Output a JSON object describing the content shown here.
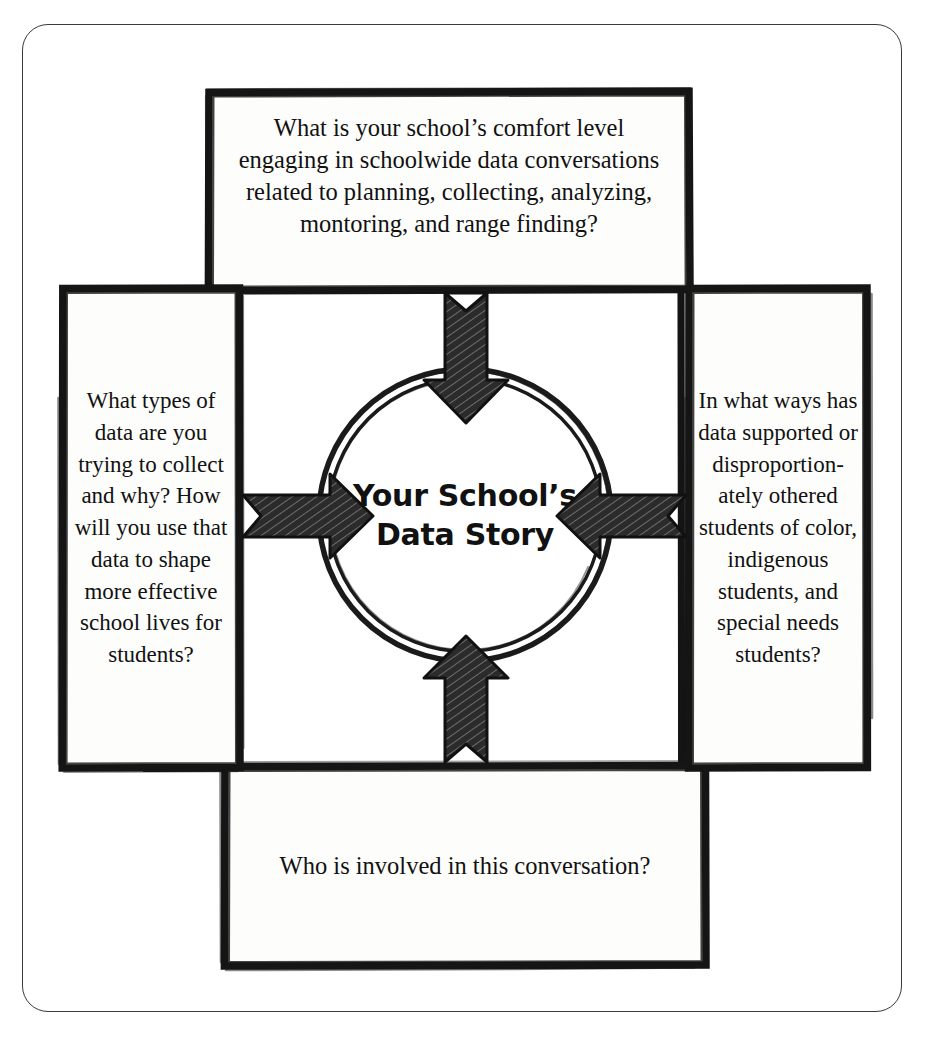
{
  "diagram": {
    "center": {
      "line1": "Your School’s",
      "line2": "Data Story"
    },
    "boxes": {
      "top": {
        "id": "top-question-box",
        "text": "What is your school’s comfort level engaging in schoolwide data conversations related to planning, collecting, analyzing, montoring, and range finding?"
      },
      "left": {
        "id": "left-question-box",
        "text": "What types of data are you trying to collect and why?  How will you use that data to shape more effective school lives for students?"
      },
      "right": {
        "id": "right-question-box",
        "text": "In what ways has data supported or disproportion-ately othered students of color, indigenous students, and special needs students?"
      },
      "bottom": {
        "id": "bottom-question-box",
        "text": "Who is involved in this conversation?"
      }
    },
    "arrows": [
      {
        "name": "arrow-top-down",
        "direction": "down"
      },
      {
        "name": "arrow-left-right",
        "direction": "right"
      },
      {
        "name": "arrow-right-left",
        "direction": "left"
      },
      {
        "name": "arrow-bottom-up",
        "direction": "up"
      }
    ],
    "colors": {
      "ink": "#111111",
      "frame": "#3a3a3a",
      "paper": "#ffffff"
    }
  }
}
